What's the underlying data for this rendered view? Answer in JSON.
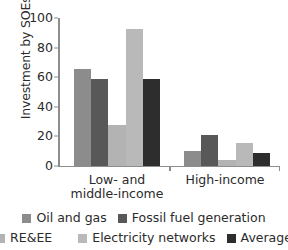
{
  "chart_data": {
    "type": "bar",
    "title": "",
    "xlabel": "",
    "ylabel": "Investment by SOEs (%)",
    "categories": [
      "Low- and\nmiddle-income",
      "High-income"
    ],
    "category_labels_flat": [
      "Low- and middle-income",
      "High-income"
    ],
    "ylim": [
      0,
      100
    ],
    "yticks": [
      0,
      20,
      40,
      60,
      80,
      100
    ],
    "ytick_labels": [
      "0",
      "20",
      "40",
      "60",
      "80",
      "100"
    ],
    "grid": false,
    "legend_position": "bottom",
    "series": [
      {
        "name": "Oil and gas",
        "color": "#8c8c8c",
        "values": [
          65.5,
          10.0
        ]
      },
      {
        "name": "Fossil fuel generation",
        "color": "#585858",
        "values": [
          58.7,
          20.8
        ]
      },
      {
        "name": "RE&EE",
        "color": "#b3b3b3",
        "values": [
          27.5,
          3.5
        ]
      },
      {
        "name": "Electricity networks",
        "color": "#b9b9b9",
        "values": [
          92.5,
          15.4
        ]
      },
      {
        "name": "Average",
        "color": "#2d2d2d",
        "values": [
          58.7,
          8.8
        ]
      }
    ]
  },
  "legend": {
    "rows": [
      [
        {
          "label": "Oil and gas",
          "color": "#8c8c8c"
        },
        {
          "label": "Fossil fuel generation",
          "color": "#585858"
        }
      ],
      [
        {
          "label": "RE&EE",
          "color": "#b3b3b3"
        },
        {
          "label": "Electricity networks",
          "color": "#b9b9b9"
        },
        {
          "label": "Average",
          "color": "#2d2d2d"
        }
      ]
    ]
  },
  "axis": {
    "line_color": "#8d8d8d",
    "text_color": "#2b2b2b"
  }
}
